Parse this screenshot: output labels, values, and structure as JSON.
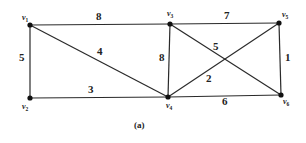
{
  "figure": {
    "caption": "(a)",
    "vertices": [
      {
        "id": "v1",
        "base": "v",
        "sub": "1",
        "x": 30,
        "y": 25,
        "lx": 22,
        "ly": 20
      },
      {
        "id": "v2",
        "base": "v",
        "sub": "2",
        "x": 30,
        "y": 98,
        "lx": 22,
        "ly": 109
      },
      {
        "id": "v3",
        "base": "v",
        "sub": "3",
        "x": 170,
        "y": 24,
        "lx": 167,
        "ly": 16
      },
      {
        "id": "v4",
        "base": "v",
        "sub": "4",
        "x": 168,
        "y": 97,
        "lx": 166,
        "ly": 108
      },
      {
        "id": "v5",
        "base": "v",
        "sub": "5",
        "x": 279,
        "y": 23,
        "lx": 282,
        "ly": 17
      },
      {
        "id": "v6",
        "base": "v",
        "sub": "6",
        "x": 281,
        "y": 95,
        "lx": 283,
        "ly": 104
      }
    ],
    "edges": [
      {
        "from": "v1",
        "to": "v3",
        "weight": "8",
        "lx": 96,
        "ly": 20
      },
      {
        "from": "v1",
        "to": "v2",
        "weight": "5",
        "lx": 19,
        "ly": 61
      },
      {
        "from": "v1",
        "to": "v4",
        "weight": "4",
        "lx": 97,
        "ly": 55
      },
      {
        "from": "v2",
        "to": "v4",
        "weight": "3",
        "lx": 88,
        "ly": 93
      },
      {
        "from": "v3",
        "to": "v4",
        "weight": "8",
        "lx": 159,
        "ly": 61
      },
      {
        "from": "v3",
        "to": "v5",
        "weight": "7",
        "lx": 224,
        "ly": 19
      },
      {
        "from": "v3",
        "to": "v6",
        "weight": "5",
        "lx": 213,
        "ly": 50
      },
      {
        "from": "v4",
        "to": "v5",
        "weight": "2",
        "lx": 206,
        "ly": 82
      },
      {
        "from": "v5",
        "to": "v6",
        "weight": "1",
        "lx": 285,
        "ly": 61
      },
      {
        "from": "v4",
        "to": "v6",
        "weight": "6",
        "lx": 222,
        "ly": 105
      }
    ]
  }
}
